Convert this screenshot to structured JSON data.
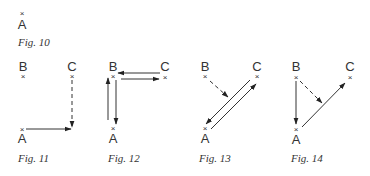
{
  "figures": [
    {
      "id": "fig10",
      "caption": "Fig. 10",
      "points": [
        {
          "label": "A",
          "x": 22,
          "y": 13
        }
      ],
      "arrows": []
    },
    {
      "id": "fig11",
      "caption": "Fig. 11",
      "points": [
        {
          "label": "B",
          "x": 23,
          "y": 75
        },
        {
          "label": "C",
          "x": 72,
          "y": 75
        },
        {
          "label": "A",
          "x": 22,
          "y": 129
        }
      ],
      "arrows": [
        {
          "from": "C",
          "to": "corner",
          "style": "dashed"
        },
        {
          "from": "A",
          "to": "corner",
          "style": "solid"
        }
      ]
    },
    {
      "id": "fig12",
      "caption": "Fig. 12",
      "points": [
        {
          "label": "B",
          "x": 113,
          "y": 75
        },
        {
          "label": "C",
          "x": 165,
          "y": 76
        },
        {
          "label": "A",
          "x": 113,
          "y": 129
        }
      ],
      "arrows": [
        {
          "from": "C",
          "to": "B",
          "style": "solid"
        },
        {
          "from": "B",
          "to": "C",
          "style": "solid"
        },
        {
          "from": "A",
          "to": "B",
          "style": "solid"
        },
        {
          "from": "B",
          "to": "A",
          "style": "solid"
        }
      ]
    },
    {
      "id": "fig13",
      "caption": "Fig. 13",
      "points": [
        {
          "label": "B",
          "x": 205,
          "y": 75
        },
        {
          "label": "C",
          "x": 257,
          "y": 75
        },
        {
          "label": "A",
          "x": 205,
          "y": 129
        }
      ],
      "arrows": [
        {
          "from": "B",
          "to": "AC-midpoint",
          "style": "dashed"
        },
        {
          "from": "C",
          "to": "A",
          "style": "solid"
        },
        {
          "from": "A",
          "to": "C",
          "style": "solid"
        }
      ]
    },
    {
      "id": "fig14",
      "caption": "Fig. 14",
      "points": [
        {
          "label": "B",
          "x": 296,
          "y": 76
        },
        {
          "label": "C",
          "x": 350,
          "y": 77
        },
        {
          "label": "A",
          "x": 296,
          "y": 130
        }
      ],
      "arrows": [
        {
          "from": "B",
          "to": "A",
          "style": "solid"
        },
        {
          "from": "B",
          "to": "AC-midpoint",
          "style": "dashed"
        },
        {
          "from": "A",
          "to": "C",
          "style": "solid"
        }
      ]
    }
  ],
  "labels": {
    "A": "A",
    "B": "B",
    "C": "C",
    "mark": "×"
  },
  "colors": {
    "ink": "#333333",
    "background": "#ffffff"
  }
}
